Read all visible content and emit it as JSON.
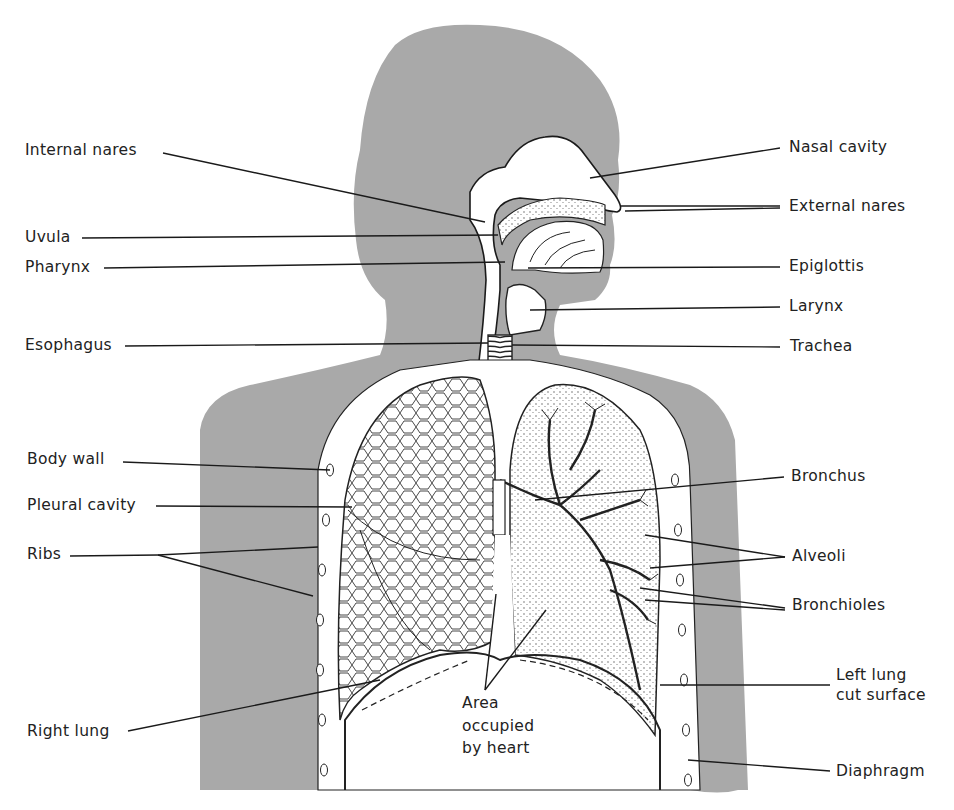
{
  "diagram": {
    "type": "anatomical-illustration",
    "colors": {
      "silhouette": "#a9a9a9",
      "background": "#ffffff",
      "line": "#1a1a1a",
      "label_text": "#222222"
    },
    "labels_left": [
      {
        "id": "internal-nares",
        "text": "Internal nares"
      },
      {
        "id": "uvula",
        "text": "Uvula"
      },
      {
        "id": "pharynx",
        "text": "Pharynx"
      },
      {
        "id": "esophagus",
        "text": "Esophagus"
      },
      {
        "id": "body-wall",
        "text": "Body wall"
      },
      {
        "id": "pleural-cavity",
        "text": "Pleural cavity"
      },
      {
        "id": "ribs",
        "text": "Ribs"
      },
      {
        "id": "right-lung",
        "text": "Right lung"
      }
    ],
    "labels_right": [
      {
        "id": "nasal-cavity",
        "text": "Nasal cavity"
      },
      {
        "id": "external-nares",
        "text": "External nares"
      },
      {
        "id": "epiglottis",
        "text": "Epiglottis"
      },
      {
        "id": "larynx",
        "text": "Larynx"
      },
      {
        "id": "trachea",
        "text": "Trachea"
      },
      {
        "id": "bronchus",
        "text": "Bronchus"
      },
      {
        "id": "alveoli",
        "text": "Alveoli"
      },
      {
        "id": "bronchioles",
        "text": "Bronchioles"
      },
      {
        "id": "left-lung-cut-surface",
        "text": "Left lung cut surface",
        "line1": "Left lung",
        "line2": "cut surface"
      },
      {
        "id": "diaphragm",
        "text": "Diaphragm"
      }
    ],
    "labels_center": [
      {
        "id": "heart-area",
        "text": "Area occupied by heart",
        "line1": "Area",
        "line2": "occupied",
        "line3": "by heart"
      }
    ]
  }
}
